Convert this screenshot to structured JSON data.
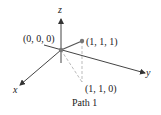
{
  "diagram": {
    "caption": "Path 1",
    "axes": {
      "x": "x",
      "y": "y",
      "z": "z"
    },
    "points": {
      "origin": "(0, 0, 0)",
      "p111": "(1, 1, 1)",
      "p110": "(1, 1, 0)"
    },
    "colors": {
      "axis": "#333333",
      "path": "#555555",
      "dashed": "#aaaaaa",
      "point": "#777777"
    }
  }
}
